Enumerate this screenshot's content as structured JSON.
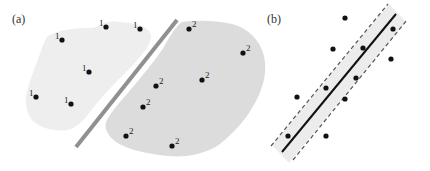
{
  "panels": {
    "a": {
      "label": "(a)",
      "class1_label": "1",
      "class2_label": "2",
      "colors": {
        "region1": "#eeeeee",
        "region2": "#dcdcdc",
        "separator": "#909090",
        "point": "#111111"
      },
      "class1_points": [
        [
          62,
          40
        ],
        [
          106,
          27
        ],
        [
          140,
          29
        ],
        [
          89,
          72
        ],
        [
          36,
          97
        ],
        [
          71,
          104
        ]
      ],
      "class2_points": [
        [
          189,
          29
        ],
        [
          243,
          53
        ],
        [
          202,
          80
        ],
        [
          156,
          86
        ],
        [
          143,
          107
        ],
        [
          126,
          136
        ],
        [
          172,
          146
        ]
      ],
      "separator": [
        [
          76,
          147
        ],
        [
          177,
          20
        ]
      ]
    },
    "b": {
      "label": "(b)",
      "colors": {
        "band": "#ececec",
        "line": "#111111",
        "dashed": "#555555",
        "point": "#111111"
      },
      "points": [
        [
          345,
          18
        ],
        [
          333,
          49
        ],
        [
          363,
          48
        ],
        [
          393,
          29
        ],
        [
          391,
          59
        ],
        [
          356,
          78
        ],
        [
          326,
          88
        ],
        [
          345,
          99
        ],
        [
          297,
          97
        ],
        [
          288,
          136
        ],
        [
          326,
          136
        ]
      ],
      "center_line": [
        [
          282,
          152
        ],
        [
          396,
          14
        ]
      ]
    }
  }
}
